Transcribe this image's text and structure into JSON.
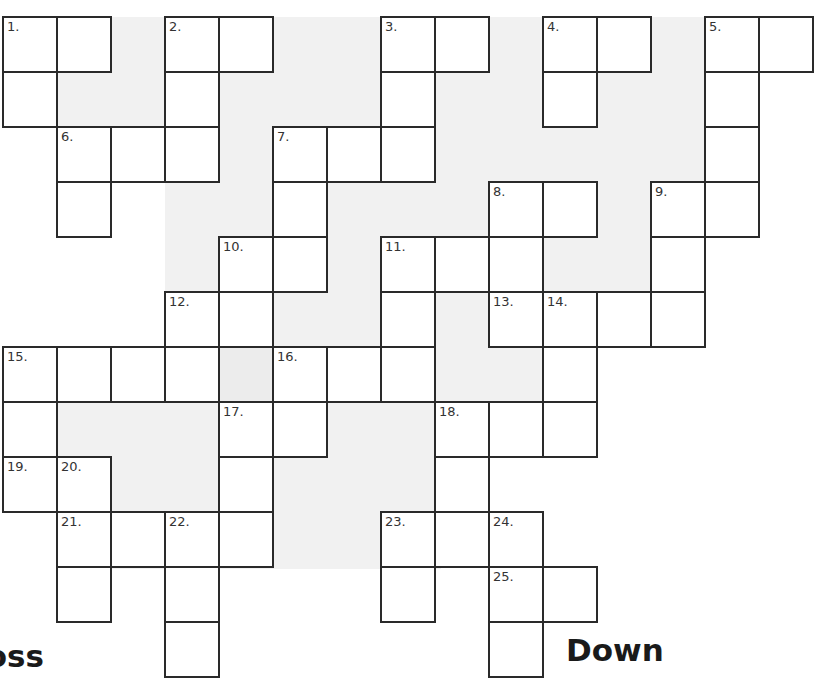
{
  "puzzle": {
    "type": "crossword",
    "cell_origin": {
      "x": 3,
      "y": 17
    },
    "cell_size": {
      "w": 54,
      "h": 55
    },
    "colors": {
      "grid_line": "#2a2a2a",
      "cell": "#ffffff",
      "background_texture": "#f1f1f1",
      "shaded_cell": "#ececec"
    },
    "cells": [
      {
        "r": 0,
        "c": 0,
        "n": "1."
      },
      {
        "r": 0,
        "c": 1
      },
      {
        "r": 0,
        "c": 3,
        "n": "2."
      },
      {
        "r": 0,
        "c": 4
      },
      {
        "r": 0,
        "c": 7,
        "n": "3."
      },
      {
        "r": 0,
        "c": 8
      },
      {
        "r": 0,
        "c": 10,
        "n": "4."
      },
      {
        "r": 0,
        "c": 11
      },
      {
        "r": 0,
        "c": 13,
        "n": "5."
      },
      {
        "r": 0,
        "c": 14
      },
      {
        "r": 1,
        "c": 0
      },
      {
        "r": 1,
        "c": 3
      },
      {
        "r": 1,
        "c": 7
      },
      {
        "r": 1,
        "c": 10
      },
      {
        "r": 1,
        "c": 13
      },
      {
        "r": 2,
        "c": 1,
        "n": "6."
      },
      {
        "r": 2,
        "c": 2
      },
      {
        "r": 2,
        "c": 3
      },
      {
        "r": 2,
        "c": 5,
        "n": "7."
      },
      {
        "r": 2,
        "c": 6
      },
      {
        "r": 2,
        "c": 7
      },
      {
        "r": 2,
        "c": 13
      },
      {
        "r": 3,
        "c": 1
      },
      {
        "r": 3,
        "c": 5
      },
      {
        "r": 3,
        "c": 9,
        "n": "8."
      },
      {
        "r": 3,
        "c": 10
      },
      {
        "r": 3,
        "c": 12,
        "n": "9."
      },
      {
        "r": 3,
        "c": 13
      },
      {
        "r": 4,
        "c": 4,
        "n": "10."
      },
      {
        "r": 4,
        "c": 5
      },
      {
        "r": 4,
        "c": 7,
        "n": "11."
      },
      {
        "r": 4,
        "c": 8
      },
      {
        "r": 4,
        "c": 9
      },
      {
        "r": 4,
        "c": 12
      },
      {
        "r": 5,
        "c": 3,
        "n": "12."
      },
      {
        "r": 5,
        "c": 4
      },
      {
        "r": 5,
        "c": 7
      },
      {
        "r": 5,
        "c": 9,
        "n": "13."
      },
      {
        "r": 5,
        "c": 10,
        "n": "14."
      },
      {
        "r": 5,
        "c": 11
      },
      {
        "r": 5,
        "c": 12
      },
      {
        "r": 6,
        "c": 0,
        "n": "15."
      },
      {
        "r": 6,
        "c": 1
      },
      {
        "r": 6,
        "c": 2
      },
      {
        "r": 6,
        "c": 3
      },
      {
        "r": 6,
        "c": 4,
        "shaded": true
      },
      {
        "r": 6,
        "c": 5,
        "n": "16."
      },
      {
        "r": 6,
        "c": 6
      },
      {
        "r": 6,
        "c": 7
      },
      {
        "r": 6,
        "c": 10
      },
      {
        "r": 7,
        "c": 0
      },
      {
        "r": 7,
        "c": 4,
        "n": "17."
      },
      {
        "r": 7,
        "c": 5
      },
      {
        "r": 7,
        "c": 8,
        "n": "18."
      },
      {
        "r": 7,
        "c": 9
      },
      {
        "r": 7,
        "c": 10
      },
      {
        "r": 8,
        "c": 0,
        "n": "19."
      },
      {
        "r": 8,
        "c": 1,
        "n": "20."
      },
      {
        "r": 8,
        "c": 4
      },
      {
        "r": 8,
        "c": 8
      },
      {
        "r": 9,
        "c": 1,
        "n": "21."
      },
      {
        "r": 9,
        "c": 2
      },
      {
        "r": 9,
        "c": 3,
        "n": "22."
      },
      {
        "r": 9,
        "c": 4
      },
      {
        "r": 9,
        "c": 7,
        "n": "23."
      },
      {
        "r": 9,
        "c": 8
      },
      {
        "r": 9,
        "c": 9,
        "n": "24."
      },
      {
        "r": 10,
        "c": 1
      },
      {
        "r": 10,
        "c": 3
      },
      {
        "r": 10,
        "c": 7
      },
      {
        "r": 10,
        "c": 9,
        "n": "25."
      },
      {
        "r": 10,
        "c": 10
      },
      {
        "r": 11,
        "c": 3
      },
      {
        "r": 11,
        "c": 9
      }
    ]
  },
  "headings": {
    "across": "Across",
    "down": "Down"
  }
}
